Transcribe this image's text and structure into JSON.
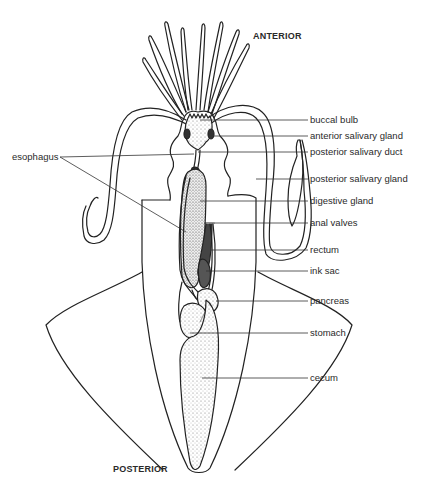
{
  "diagram": {
    "orientation": {
      "anterior": "ANTERIOR",
      "posterior": "POSTERIOR"
    },
    "labels_right": [
      {
        "id": "buccal-bulb",
        "text": "buccal bulb",
        "y": 120
      },
      {
        "id": "anterior-salivary-gland",
        "text": "anterior salivary gland",
        "y": 136
      },
      {
        "id": "posterior-salivary-duct",
        "text": "posterior salivary duct",
        "y": 152
      },
      {
        "id": "posterior-salivary-gland",
        "text": "posterior salivary gland",
        "y": 179
      },
      {
        "id": "digestive-gland",
        "text": "digestive gland",
        "y": 201
      },
      {
        "id": "anal-valves",
        "text": "anal valves",
        "y": 223
      },
      {
        "id": "rectum",
        "text": "rectum",
        "y": 250
      },
      {
        "id": "ink-sac",
        "text": "ink sac",
        "y": 271
      },
      {
        "id": "pancreas",
        "text": "pancreas",
        "y": 301
      },
      {
        "id": "stomach",
        "text": "stomach",
        "y": 333
      },
      {
        "id": "cecum",
        "text": "cecum",
        "y": 378
      }
    ],
    "labels_left": [
      {
        "id": "esophagus",
        "text": "esophagus",
        "y": 157
      }
    ],
    "colors": {
      "line": "#222222",
      "label": "#2a2a2a",
      "background": "#ffffff",
      "stipple": "#555555"
    }
  }
}
